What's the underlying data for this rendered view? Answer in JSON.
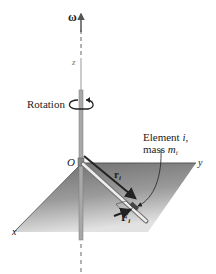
{
  "figure": {
    "type": "diagram"
  },
  "labels": {
    "omega": "ω",
    "z_axis": "z",
    "rotation": "Rotation",
    "origin": "O",
    "y_axis": "y",
    "x_axis": "x",
    "element_line1": "Element ",
    "element_i": "i",
    "element_comma": ",",
    "mass_line": "mass ",
    "mass_symbol": "m",
    "mass_sub": "i",
    "r_vector": "r",
    "r_sub": "i",
    "f_vector": "F",
    "f_sub": "i"
  },
  "colors": {
    "plane_dark": "#6e6e6e",
    "plane_light": "#d8d8d8",
    "axis": "#8a8a8a",
    "arrow": "#222222"
  }
}
